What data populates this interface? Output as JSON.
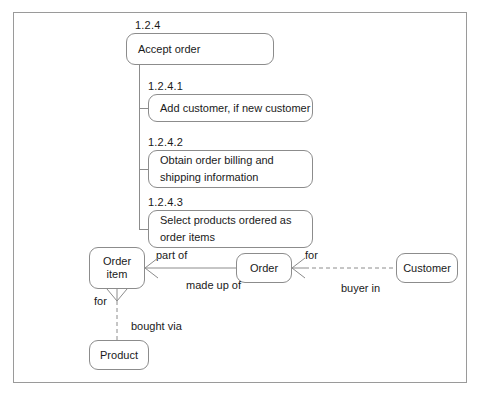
{
  "diagram": {
    "border_color": "#9a9a9a",
    "line_color": "#8c8c8c",
    "text_color": "#1a1a1a",
    "background": "#ffffff"
  },
  "tasks": {
    "parent": {
      "id": "1.2.4",
      "label": "Accept order"
    },
    "children": [
      {
        "id": "1.2.4.1",
        "label": "Add customer, if new customer"
      },
      {
        "id": "1.2.4.2",
        "label": "Obtain order billing and\nshipping information"
      },
      {
        "id": "1.2.4.3",
        "label": "Select products ordered as\norder items"
      }
    ]
  },
  "entities": [
    {
      "key": "order_item",
      "label": "Order\nitem"
    },
    {
      "key": "order",
      "label": "Order"
    },
    {
      "key": "customer",
      "label": "Customer"
    },
    {
      "key": "product",
      "label": "Product"
    }
  ],
  "relationships": [
    {
      "key": "part_of",
      "label": "part of",
      "from": "order_item",
      "to": "order"
    },
    {
      "key": "made_up_of",
      "label": "made up of",
      "from": "order",
      "to": "order_item"
    },
    {
      "key": "for_order_customer",
      "label": "for",
      "from": "order",
      "to": "customer"
    },
    {
      "key": "buyer_in",
      "label": "buyer in",
      "from": "customer",
      "to": "order"
    },
    {
      "key": "for_order_item_product",
      "label": "for",
      "from": "order_item",
      "to": "product"
    },
    {
      "key": "bought_via",
      "label": "bought via",
      "from": "product",
      "to": "order_item"
    }
  ]
}
